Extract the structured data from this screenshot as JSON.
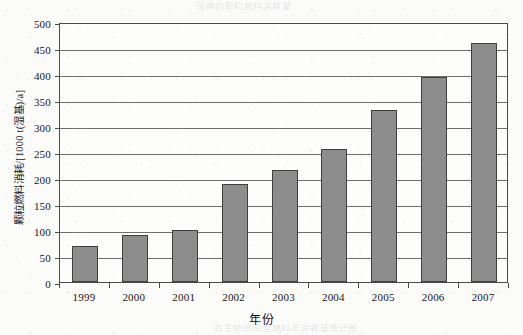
{
  "figure": {
    "y_axis_title": "颗粒燃料消耗/[1000 t(湿基)/a]",
    "x_axis_title": "年份",
    "bleed_through_top": "瑞典的颗粒燃料消耗量",
    "bleed_through_bottom": "的生物质成型燃料年消耗量统计图",
    "bar_fill_color": "#8d8d8d",
    "bar_border_color": "#3f3f3f",
    "grid_color": "#6f6f6f",
    "frame_color": "#4a4a4a",
    "paper_color": "#fbfbfa"
  },
  "chart_data": {
    "type": "bar",
    "title": "",
    "xlabel": "年份",
    "ylabel": "颗粒燃料消耗/[1000 t(湿基)/a]",
    "categories": [
      "1999",
      "2000",
      "2001",
      "2002",
      "2003",
      "2004",
      "2005",
      "2006",
      "2007"
    ],
    "values": [
      69,
      90,
      100,
      188,
      215,
      255,
      330,
      394,
      460
    ],
    "ylim": [
      0,
      500
    ],
    "ytick_values": [
      0,
      50,
      100,
      150,
      200,
      250,
      300,
      350,
      400,
      450,
      500
    ],
    "ytick_labels": [
      "0",
      "50",
      "100",
      "150",
      "200",
      "250",
      "300",
      "350",
      "400",
      "450",
      "500"
    ],
    "grid": true,
    "grid_axis": "y",
    "legend": false,
    "legend_position": "none",
    "series": [
      {
        "name": "颗粒燃料消耗",
        "values": [
          69,
          90,
          100,
          188,
          215,
          255,
          330,
          394,
          460
        ]
      }
    ]
  }
}
